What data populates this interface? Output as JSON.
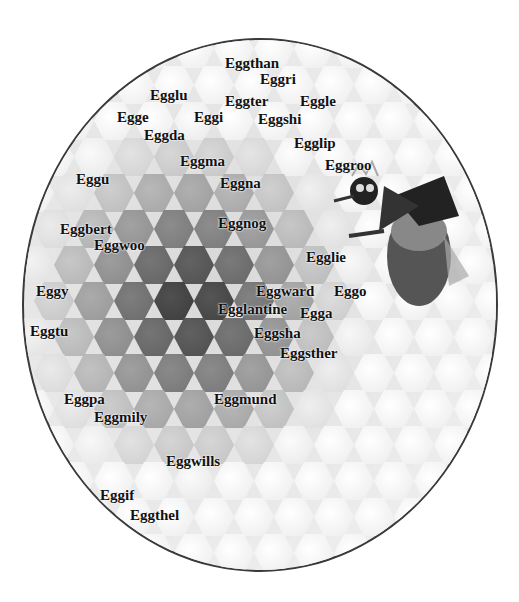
{
  "image": {
    "description": "Oval vignette of honeycomb cells containing larvae, with a costumed bee figure wearing a bow, annotated with egg names",
    "frame_color": "#3a3a3a"
  },
  "labels": [
    {
      "text": "Eggthan",
      "x": 225,
      "y": 56
    },
    {
      "text": "Eggri",
      "x": 260,
      "y": 72
    },
    {
      "text": "Egglu",
      "x": 150,
      "y": 88
    },
    {
      "text": "Eggter",
      "x": 225,
      "y": 94
    },
    {
      "text": "Eggle",
      "x": 300,
      "y": 94
    },
    {
      "text": "Egge",
      "x": 117,
      "y": 110
    },
    {
      "text": "Eggi",
      "x": 194,
      "y": 110
    },
    {
      "text": "Eggshi",
      "x": 258,
      "y": 112
    },
    {
      "text": "Eggda",
      "x": 144,
      "y": 128
    },
    {
      "text": "Egglip",
      "x": 294,
      "y": 136
    },
    {
      "text": "Eggma",
      "x": 180,
      "y": 154
    },
    {
      "text": "Eggroo",
      "x": 325,
      "y": 158
    },
    {
      "text": "Eggu",
      "x": 76,
      "y": 172
    },
    {
      "text": "Eggna",
      "x": 220,
      "y": 176
    },
    {
      "text": "Eggnog",
      "x": 218,
      "y": 216
    },
    {
      "text": "Eggbert",
      "x": 60,
      "y": 222
    },
    {
      "text": "Eggwoo",
      "x": 94,
      "y": 238
    },
    {
      "text": "Egglie",
      "x": 306,
      "y": 250
    },
    {
      "text": "Eggy",
      "x": 36,
      "y": 284
    },
    {
      "text": "Eggward",
      "x": 256,
      "y": 284
    },
    {
      "text": "Eggo",
      "x": 334,
      "y": 284
    },
    {
      "text": "Egglantine",
      "x": 218,
      "y": 302
    },
    {
      "text": "Egga",
      "x": 300,
      "y": 306
    },
    {
      "text": "Eggtu",
      "x": 30,
      "y": 324
    },
    {
      "text": "Eggsha",
      "x": 254,
      "y": 326
    },
    {
      "text": "Eggsther",
      "x": 280,
      "y": 346
    },
    {
      "text": "Eggpa",
      "x": 64,
      "y": 392
    },
    {
      "text": "Eggmund",
      "x": 214,
      "y": 392
    },
    {
      "text": "Eggmily",
      "x": 94,
      "y": 410
    },
    {
      "text": "Eggwills",
      "x": 166,
      "y": 454
    },
    {
      "text": "Eggif",
      "x": 100,
      "y": 488
    },
    {
      "text": "Eggthel",
      "x": 130,
      "y": 508
    }
  ]
}
